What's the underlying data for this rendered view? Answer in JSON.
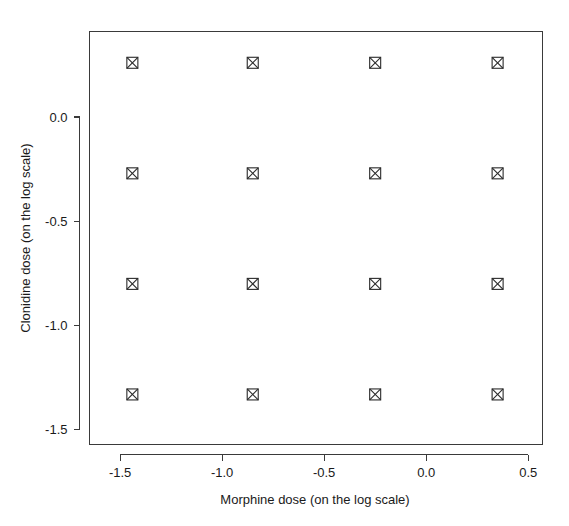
{
  "figure": {
    "name": "morphine-clonidine-dose-grid",
    "background_color": "#ffffff",
    "foreground_color": "#1a1a1a",
    "marker_color": "#2b2b2b",
    "axis_color": "#3a3a3a"
  },
  "chart_data": {
    "type": "scatter",
    "title": "",
    "xlabel": "Morphine dose (on the log scale)",
    "ylabel": "Clonidine dose (on the log scale)",
    "xlim": [
      -1.65,
      0.57
    ],
    "ylim": [
      -1.57,
      0.41
    ],
    "grid": false,
    "legend": false,
    "legend_position": "none",
    "marker_symbol": "square-with-x",
    "marker_size": 11,
    "xticks": [
      -1.5,
      -1.0,
      -0.5,
      0.0,
      0.5
    ],
    "xticklabels": [
      "-1.5",
      "-1.0",
      "-0.5",
      "0.0",
      "0.5"
    ],
    "yticks": [
      0.0,
      -0.5,
      -1.0,
      -1.5
    ],
    "yticklabels": [
      "0.0",
      "-0.5",
      "-1.0",
      "-1.5"
    ],
    "x_levels": [
      -1.44,
      -0.85,
      -0.25,
      0.35
    ],
    "y_levels": [
      0.26,
      -0.27,
      -0.8,
      -1.33
    ],
    "n_points": 16,
    "points": [
      {
        "x": -1.44,
        "y": 0.26
      },
      {
        "x": -0.85,
        "y": 0.26
      },
      {
        "x": -0.25,
        "y": 0.26
      },
      {
        "x": 0.35,
        "y": 0.26
      },
      {
        "x": -1.44,
        "y": -0.27
      },
      {
        "x": -0.85,
        "y": -0.27
      },
      {
        "x": -0.25,
        "y": -0.27
      },
      {
        "x": 0.35,
        "y": -0.27
      },
      {
        "x": -1.44,
        "y": -0.8
      },
      {
        "x": -0.85,
        "y": -0.8
      },
      {
        "x": -0.25,
        "y": -0.8
      },
      {
        "x": 0.35,
        "y": -0.8
      },
      {
        "x": -1.44,
        "y": -1.33
      },
      {
        "x": -0.85,
        "y": -1.33
      },
      {
        "x": -0.25,
        "y": -1.33
      },
      {
        "x": 0.35,
        "y": -1.33
      }
    ]
  }
}
